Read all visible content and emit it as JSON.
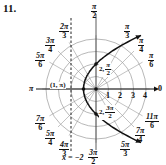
{
  "problem_number": "11.",
  "polar_grid": {
    "pole": [
      96,
      89
    ],
    "px_per_unit": 12.5,
    "rings": [
      1,
      2,
      3,
      4
    ],
    "ray_angles_deg": [
      0,
      30,
      45,
      60,
      90,
      120,
      135,
      150,
      180,
      210,
      225,
      240,
      270,
      300,
      315,
      330
    ],
    "radial_tick_labels": [
      "1",
      "2",
      "3",
      "4"
    ],
    "axis_end_label": "0"
  },
  "angle_labels": {
    "pi_over_2": {
      "num": "π",
      "den": "2"
    },
    "pi_over_3": {
      "num": "π",
      "den": "3"
    },
    "pi_over_4": {
      "num": "π",
      "den": "4"
    },
    "pi_over_6": {
      "num": "π",
      "den": "6"
    },
    "two_pi_over_3": {
      "num": "2π",
      "den": "3"
    },
    "three_pi_over_4": {
      "num": "3π",
      "den": "4"
    },
    "five_pi_over_6": {
      "num": "5π",
      "den": "6"
    },
    "pi": "π",
    "seven_pi_over_6": {
      "num": "7π",
      "den": "6"
    },
    "five_pi_over_4": {
      "num": "5π",
      "den": "4"
    },
    "four_pi_over_3": {
      "num": "4π",
      "den": "3"
    },
    "three_pi_over_2": {
      "num": "3π",
      "den": "2"
    },
    "five_pi_over_3": {
      "num": "5π",
      "den": "3"
    },
    "seven_pi_over_4": {
      "num": "7π",
      "den": "4"
    },
    "eleven_pi_over_6": {
      "num": "11π",
      "den": "6"
    }
  },
  "curve": {
    "equation": "r = 2/(1 - cos θ)",
    "color": "#111111"
  },
  "points": {
    "vertex": {
      "label": "(1, π)",
      "r": 1,
      "theta_deg": 180
    },
    "top": {
      "label_prefix": "2,",
      "num": "π",
      "den": "2",
      "r": 2,
      "theta_deg": 90
    },
    "bottom": {
      "label_prefix": "2,",
      "num": "3π",
      "den": "2",
      "r": 2,
      "theta_deg": 270
    }
  },
  "directrix": {
    "label": "x = −2",
    "x_value": -2
  }
}
